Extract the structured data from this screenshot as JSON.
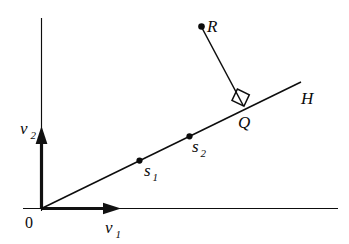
{
  "figure": {
    "background_color": "#ffffff",
    "ink_color": "#0b0b0b",
    "width": 349,
    "height": 244
  },
  "axes": {
    "origin_label": "0",
    "horizontal": {
      "vector_label": "v",
      "vector_subscript": "1",
      "arrow_direction": "right"
    },
    "vertical": {
      "vector_label": "v",
      "vector_subscript": "2",
      "arrow_direction": "up"
    }
  },
  "line": {
    "label": "H",
    "description": "ray from origin with positive slope"
  },
  "points": [
    {
      "id": "s1",
      "label": "s",
      "subscript": "1",
      "on_line": true
    },
    {
      "id": "s2",
      "label": "s",
      "subscript": "2",
      "on_line": true
    },
    {
      "id": "Q",
      "label": "Q",
      "subscript": "",
      "on_line": true
    },
    {
      "id": "R",
      "label": "R",
      "subscript": "",
      "on_line": false
    }
  ],
  "angle_marker": {
    "type": "right-angle",
    "at_point": "Q",
    "degrees": "90"
  }
}
